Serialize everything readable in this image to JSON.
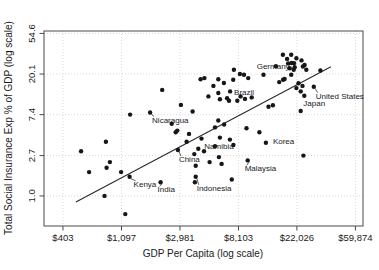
{
  "figure": {
    "width": 379,
    "height": 270,
    "background_color": "#ffffff",
    "frame_color": "#4a4a4a",
    "grid_color": "#c9c9c9",
    "point_color": "#161616",
    "line_color": "#2a2a2a",
    "text_color": "#1a1a1a"
  },
  "chart_data": {
    "type": "scatter",
    "title": "",
    "xlabel": "GDP Per Capita (log scale)",
    "ylabel": "Total Social Insurance Exp % of GDP (log scale)",
    "x_scale": "log",
    "y_scale": "log",
    "grid": "dotted",
    "x_domain_ln": [
      5.675,
      11.13
    ],
    "y_domain_ln": [
      -0.74,
      4.06
    ],
    "x_ticks": [
      {
        "value": 403,
        "label": "$403"
      },
      {
        "value": 1097,
        "label": "$1,097"
      },
      {
        "value": 2981,
        "label": "$2,981"
      },
      {
        "value": 8103,
        "label": "$8,103"
      },
      {
        "value": 22026,
        "label": "$22,026"
      },
      {
        "value": 59874,
        "label": "$59,874"
      }
    ],
    "y_ticks": [
      {
        "value": 1.0,
        "label": "1.0"
      },
      {
        "value": 2.7,
        "label": "2.7"
      },
      {
        "value": 7.4,
        "label": "7.4"
      },
      {
        "value": 20.1,
        "label": "20.1"
      },
      {
        "value": 54.6,
        "label": "54.6"
      }
    ],
    "trend_line": {
      "x1": 503,
      "y1": 0.86,
      "x2": 39400,
      "y2": 24.0
    },
    "labeled_points": [
      {
        "name": "Germany",
        "gdp": 20100,
        "pct": 26.4,
        "dx": -2,
        "dy": 6,
        "anchor": "end",
        "leader": false
      },
      {
        "name": "United States",
        "gdp": 29400,
        "pct": 14.7,
        "dx": 2,
        "dy": 12,
        "anchor": "start",
        "leader": true
      },
      {
        "name": "Japan",
        "gdp": 25000,
        "pct": 11.8,
        "dx": -1,
        "dy": 10,
        "anchor": "start",
        "leader": false
      },
      {
        "name": "Brazil",
        "gdp": 7020,
        "pct": 13.1,
        "dx": 4,
        "dy": 4,
        "anchor": "start",
        "leader": false
      },
      {
        "name": "Nicaragua",
        "gdp": 1790,
        "pct": 7.8,
        "dx": 2,
        "dy": 10,
        "anchor": "start",
        "leader": true
      },
      {
        "name": "Korea",
        "gdp": 12970,
        "pct": 3.7,
        "dx": 7,
        "dy": 1,
        "anchor": "start",
        "leader": false
      },
      {
        "name": "Namibia",
        "gdp": 4080,
        "pct": 3.2,
        "dx": 6,
        "dy": 0,
        "anchor": "start",
        "leader": false
      },
      {
        "name": "China",
        "gdp": 2880,
        "pct": 3.1,
        "dx": 1,
        "dy": 12,
        "anchor": "start",
        "leader": true
      },
      {
        "name": "Malaysia",
        "gdp": 9500,
        "pct": 2.4,
        "dx": -3,
        "dy": 11,
        "anchor": "start",
        "leader": true
      },
      {
        "name": "Indonesia",
        "gdp": 3900,
        "pct": 1.6,
        "dx": 1,
        "dy": 14,
        "anchor": "start",
        "leader": true
      },
      {
        "name": "Kenya",
        "gdp": 1260,
        "pct": 1.6,
        "dx": 4,
        "dy": 10,
        "anchor": "start",
        "leader": true
      },
      {
        "name": "India",
        "gdp": 2140,
        "pct": 1.4,
        "dx": -3,
        "dy": 10,
        "anchor": "start",
        "leader": true
      }
    ],
    "points": [
      [
        1270,
        7.4
      ],
      [
        2200,
        13.6
      ],
      [
        3030,
        9.4
      ],
      [
        2590,
        5.9
      ],
      [
        2770,
        4.8
      ],
      [
        4240,
        17.7
      ],
      [
        4530,
        18.2
      ],
      [
        5740,
        17.7
      ],
      [
        6320,
        16.1
      ],
      [
        5280,
        15.0
      ],
      [
        4850,
        11.6
      ],
      [
        5740,
        12.6
      ],
      [
        5900,
        10.8
      ],
      [
        6680,
        11.1
      ],
      [
        6900,
        10.4
      ],
      [
        3700,
        8.0
      ],
      [
        5740,
        6.4
      ],
      [
        5430,
        5.4
      ],
      [
        6340,
        5.8
      ],
      [
        7500,
        22.3
      ],
      [
        8310,
        20.1
      ],
      [
        8910,
        19.7
      ],
      [
        9570,
        18.2
      ],
      [
        7410,
        17.5
      ],
      [
        8410,
        11.6
      ],
      [
        9060,
        10.9
      ],
      [
        7940,
        10.4
      ],
      [
        10160,
        11.3
      ],
      [
        12430,
        19.7
      ],
      [
        15370,
        24.3
      ],
      [
        17400,
        17.5
      ],
      [
        16270,
        16.5
      ],
      [
        13540,
        9.0
      ],
      [
        14610,
        9.3
      ],
      [
        17330,
        32.3
      ],
      [
        19960,
        32.3
      ],
      [
        18630,
        29.2
      ],
      [
        21830,
        29.7
      ],
      [
        23840,
        28.1
      ],
      [
        18950,
        26.1
      ],
      [
        20940,
        26.2
      ],
      [
        25130,
        25.1
      ],
      [
        24410,
        24.2
      ],
      [
        21190,
        23.8
      ],
      [
        19470,
        23.2
      ],
      [
        20830,
        22.3
      ],
      [
        25860,
        22.3
      ],
      [
        19960,
        19.7
      ],
      [
        17830,
        17.8
      ],
      [
        22620,
        16.0
      ],
      [
        24240,
        15.0
      ],
      [
        21830,
        14.2
      ],
      [
        23490,
        13.1
      ],
      [
        23490,
        8.1
      ],
      [
        32930,
        21.9
      ],
      [
        24600,
        2.7
      ],
      [
        2850,
        5.0
      ],
      [
        3480,
        4.6
      ],
      [
        3340,
        3.8
      ],
      [
        3810,
        2.8
      ],
      [
        4500,
        3.0
      ],
      [
        5430,
        3.4
      ],
      [
        7430,
        3.5
      ],
      [
        5800,
        2.6
      ],
      [
        4950,
        2.3
      ],
      [
        3900,
        2.1
      ],
      [
        7230,
        1.5
      ],
      [
        6080,
        2.2
      ],
      [
        4310,
        4.1
      ],
      [
        5900,
        4.2
      ],
      [
        7000,
        4.0
      ],
      [
        3850,
        1.4
      ],
      [
        9300,
        5.3
      ],
      [
        11600,
        4.8
      ],
      [
        840,
        3.8
      ],
      [
        550,
        3.0
      ],
      [
        900,
        2.3
      ],
      [
        850,
        2.0
      ],
      [
        630,
        1.8
      ],
      [
        1090,
        1.8
      ],
      [
        820,
        1.0
      ],
      [
        1170,
        0.64
      ]
    ]
  }
}
